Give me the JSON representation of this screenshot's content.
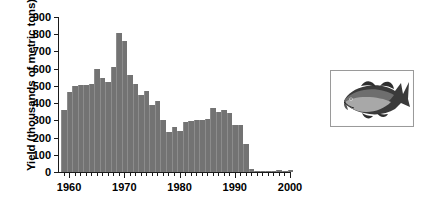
{
  "chart_data": {
    "type": "bar",
    "title": "",
    "xlabel": "",
    "ylabel": "Yield (thousands of metric tons)",
    "ylim": [
      0,
      900
    ],
    "xlim": [
      1958,
      2000
    ],
    "grid": false,
    "legend": null,
    "bar_color": "#737373",
    "ytick_labels": [
      "0",
      "100",
      "200",
      "300",
      "400",
      "500",
      "600",
      "700",
      "800",
      "900"
    ],
    "ytick_values": [
      0,
      100,
      200,
      300,
      400,
      500,
      600,
      700,
      800,
      900
    ],
    "xtick_labels": [
      "1960",
      "1970",
      "1980",
      "1990",
      "2000"
    ],
    "xtick_values": [
      1960,
      1970,
      1980,
      1990,
      2000
    ],
    "x": [
      1959,
      1960,
      1961,
      1962,
      1963,
      1964,
      1965,
      1966,
      1967,
      1968,
      1969,
      1970,
      1971,
      1972,
      1973,
      1974,
      1975,
      1976,
      1977,
      1978,
      1979,
      1980,
      1981,
      1982,
      1983,
      1984,
      1985,
      1986,
      1987,
      1988,
      1989,
      1990,
      1991,
      1992,
      1993,
      1994,
      1995,
      1996,
      1997,
      1998,
      1999,
      2000
    ],
    "categories": [
      "1959",
      "1960",
      "1961",
      "1962",
      "1963",
      "1964",
      "1965",
      "1966",
      "1967",
      "1968",
      "1969",
      "1970",
      "1971",
      "1972",
      "1973",
      "1974",
      "1975",
      "1976",
      "1977",
      "1978",
      "1979",
      "1980",
      "1981",
      "1982",
      "1983",
      "1984",
      "1985",
      "1986",
      "1987",
      "1988",
      "1989",
      "1990",
      "1991",
      "1992",
      "1993",
      "1994",
      "1995",
      "1996",
      "1997",
      "1998",
      "1999",
      "2000"
    ],
    "values": [
      358,
      465,
      500,
      505,
      505,
      510,
      600,
      545,
      525,
      610,
      810,
      760,
      565,
      510,
      450,
      470,
      390,
      410,
      300,
      230,
      260,
      240,
      290,
      295,
      300,
      300,
      310,
      370,
      350,
      360,
      340,
      275,
      275,
      160,
      20,
      8,
      6,
      6,
      6,
      10,
      8,
      12
    ]
  },
  "inset": {
    "name": "atlantic-cod-photograph",
    "caption": ""
  }
}
